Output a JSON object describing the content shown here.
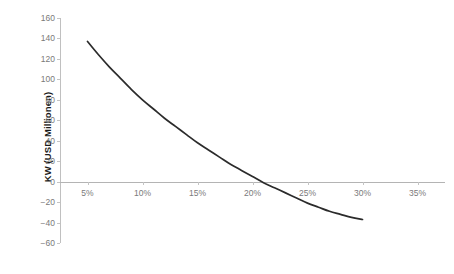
{
  "chart_data": {
    "type": "line",
    "title": "",
    "xlabel": "",
    "ylabel": "KW (USD Millionen)",
    "xlim": [
      2.5,
      37.5
    ],
    "ylim": [
      -60,
      160
    ],
    "grid": false,
    "legend": null,
    "xticks": [
      "5%",
      "10%",
      "15%",
      "20%",
      "25%",
      "30%",
      "35%"
    ],
    "xtick_values": [
      5,
      10,
      15,
      20,
      25,
      30,
      35
    ],
    "yticks": [
      "160",
      "140",
      "120",
      "100",
      "80",
      "60",
      "40",
      "20",
      "0",
      "-20",
      "-40",
      "-60"
    ],
    "ytick_values": [
      160,
      140,
      120,
      100,
      80,
      60,
      40,
      20,
      0,
      -20,
      -40,
      -60
    ],
    "series": [
      {
        "name": "KW",
        "color": "#2b2b2b",
        "x": [
          5,
          6,
          7,
          8,
          9,
          10,
          11,
          12,
          13,
          14,
          15,
          16,
          17,
          18,
          19,
          20,
          21,
          22,
          23,
          24,
          25,
          26,
          27,
          28,
          29,
          30
        ],
        "values": [
          137,
          124,
          112,
          101,
          90,
          80,
          71,
          62,
          54,
          46,
          38,
          31,
          24,
          17,
          11,
          5,
          -1,
          -6,
          -11,
          -16,
          -21,
          -25,
          -29,
          -32,
          -35,
          -37
        ]
      }
    ],
    "zero_crossing_x": 20.8,
    "axis_color": "#bebebe",
    "tick_text_color": "#7a7a7a",
    "background": "#ffffff"
  },
  "clipped": {
    "top_text": "",
    "bottom_text": ""
  }
}
